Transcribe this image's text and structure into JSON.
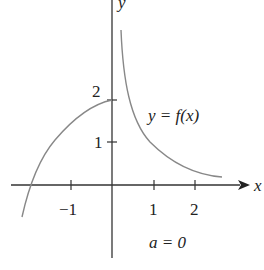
{
  "figure": {
    "axis_x_label": "x",
    "axis_y_label": "y",
    "x_ticks": [
      {
        "value": -1,
        "label": "−1"
      },
      {
        "value": 1,
        "label": "1"
      },
      {
        "value": 2,
        "label": "2"
      }
    ],
    "y_ticks": [
      {
        "value": 1,
        "label": "1"
      },
      {
        "value": 2,
        "label": "2"
      }
    ],
    "curve_label": "y = f(x)",
    "parameter_label": "a = 0",
    "colors": {
      "axes": "#333333",
      "curve": "#888888",
      "text": "#222222"
    }
  }
}
